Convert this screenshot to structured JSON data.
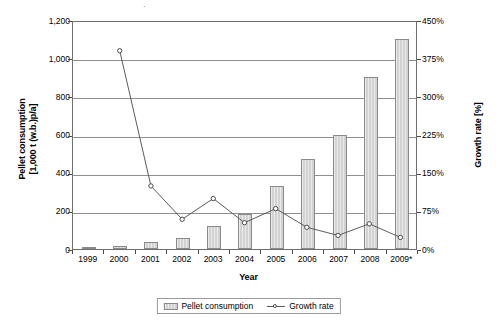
{
  "chart_data": {
    "type": "bar",
    "title": "",
    "xlabel": "Year",
    "ylabel": "Pellet consumption",
    "ylabel_line2": "[1,000 t (w.b.)p/a]",
    "ylabel_right": "Growth rate [%]",
    "categories": [
      "1999",
      "2000",
      "2001",
      "2002",
      "2003",
      "2004",
      "2005",
      "2006",
      "2007",
      "2008",
      "2009*"
    ],
    "ylim": [
      0,
      1200
    ],
    "ylim_right": [
      0,
      450
    ],
    "yticks": [
      "0",
      "200",
      "400",
      "600",
      "800",
      "1,000",
      "1,200"
    ],
    "ytick_values": [
      0,
      200,
      400,
      600,
      800,
      1000,
      1200
    ],
    "yticks_right": [
      "0%",
      "75%",
      "150%",
      "225%",
      "300%",
      "375%",
      "450%"
    ],
    "ytick_values_right": [
      0,
      75,
      150,
      225,
      300,
      375,
      450
    ],
    "grid": true,
    "legend_position": "bottom",
    "series": [
      {
        "name": "Pellet consumption",
        "type": "bar",
        "axis": "left",
        "values": [
          3,
          18,
          38,
          58,
          120,
          183,
          330,
          473,
          600,
          900,
          1100
        ]
      },
      {
        "name": "Growth rate",
        "type": "line",
        "axis": "right",
        "marker": "circle",
        "values": [
          null,
          393,
          125,
          59,
          100,
          52,
          80,
          43,
          27,
          50,
          23
        ]
      }
    ]
  },
  "legend": {
    "items": [
      {
        "label": "Pellet consumption",
        "marker": "bar-swatch"
      },
      {
        "label": "Growth rate",
        "marker": "line-circle"
      }
    ]
  },
  "colors": {
    "bar_fill": "#d2d2d2",
    "bar_border": "#8a8a8a",
    "line": "#5a5a5a",
    "marker_edge": "#4a4a4a",
    "marker_fill": "#ffffff",
    "grid": "#8f8f8f",
    "axis": "#6e6e6e",
    "text": "#000000"
  }
}
